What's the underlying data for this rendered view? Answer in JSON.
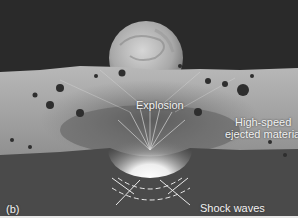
{
  "figure": {
    "panel_label": "(b)",
    "labels": {
      "explosion": "Explosion",
      "ejecta_line1": "High-speed",
      "ejecta_line2": "ejected material",
      "shock_waves": "Shock waves"
    },
    "colors": {
      "sky": "#2a2a2a",
      "planet": "#b5b5b5",
      "surface": "#9a9a9a",
      "ground": "#4a4a4a",
      "glow": "#ffffff",
      "text": "#f2f2f2"
    }
  }
}
